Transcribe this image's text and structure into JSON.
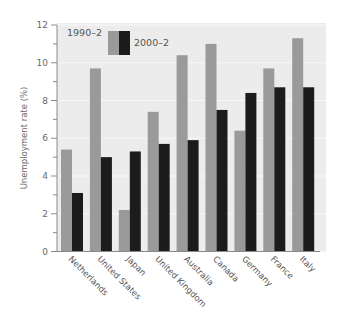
{
  "chart_data": {
    "type": "bar",
    "title": "",
    "xlabel": "",
    "ylabel": "Unemployment rate (%)",
    "ylim": [
      0,
      12
    ],
    "yticks": [
      0,
      2,
      4,
      6,
      8,
      10,
      12
    ],
    "grid": true,
    "legend_position": "top-left inside plot",
    "categories": [
      "Netherlands",
      "United States",
      "Japan",
      "United Kingdom",
      "Australia",
      "Canada",
      "Germany",
      "France",
      "Italy"
    ],
    "series": [
      {
        "name": "1990–2",
        "color": "#9a9a9a",
        "values": [
          5.4,
          9.7,
          2.2,
          7.4,
          10.4,
          11.0,
          6.4,
          9.7,
          11.3
        ]
      },
      {
        "name": "2000–2",
        "color": "#1c1c1c",
        "values": [
          3.1,
          5.0,
          5.3,
          5.7,
          5.9,
          7.5,
          8.4,
          8.7,
          8.7
        ]
      }
    ]
  },
  "colors": {
    "plot_background": "#ececec",
    "gridline": "#f8f8f8",
    "axis": "#8a8a8a"
  }
}
